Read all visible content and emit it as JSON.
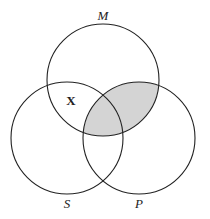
{
  "diagram": {
    "type": "venn-3",
    "circles": [
      {
        "id": "M",
        "label": "M",
        "cx": 103,
        "cy": 80,
        "r": 56,
        "label_x": 103,
        "label_y": 20
      },
      {
        "id": "S",
        "label": "S",
        "cx": 67,
        "cy": 138,
        "r": 56,
        "label_x": 67,
        "label_y": 208
      },
      {
        "id": "P",
        "label": "P",
        "cx": 139,
        "cy": 138,
        "r": 56,
        "label_x": 139,
        "label_y": 208
      }
    ],
    "shaded_regions": [
      "M∩P"
    ],
    "shade_color": "#d4d4d4",
    "marks": [
      {
        "symbol": "X",
        "region": "M∩S only",
        "x": 71,
        "y": 105
      }
    ]
  }
}
